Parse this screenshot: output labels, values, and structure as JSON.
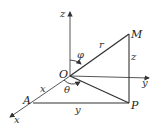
{
  "diagram": {
    "type": "spherical-coordinates",
    "axes": {
      "x_label": "x",
      "y_label": "y",
      "z_label": "z"
    },
    "points": {
      "origin": "O",
      "point_m": "M",
      "point_p": "P",
      "point_a": "A"
    },
    "segments": {
      "om_label": "r",
      "mp_label": "z",
      "oa_label": "x",
      "ap_label": "y"
    },
    "angles": {
      "phi_label": "φ",
      "theta_label": "θ"
    },
    "colors": {
      "line": "#333333",
      "background": "#ffffff"
    }
  }
}
